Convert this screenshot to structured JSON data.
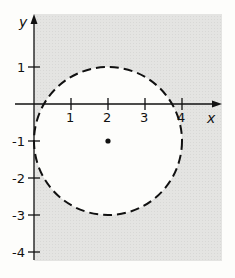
{
  "diagram": {
    "axes": {
      "x_label": "x",
      "y_label": "y",
      "x_ticks": [
        "1",
        "2",
        "3",
        "4"
      ],
      "y_ticks": [
        "1",
        "-1",
        "-2",
        "-3",
        "-4"
      ]
    },
    "circle": {
      "center": [
        2,
        -1
      ],
      "radius": 2,
      "boundary_style": "dashed"
    },
    "colors": {
      "shading": "#e2e2e0",
      "background": "#fdfdfb",
      "ink": "#111111"
    }
  }
}
